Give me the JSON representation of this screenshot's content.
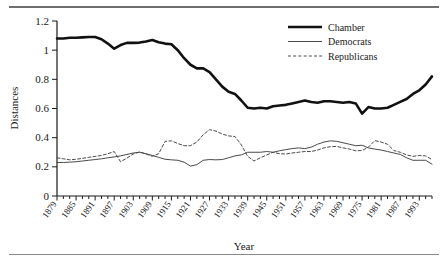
{
  "chart_data": {
    "type": "line",
    "title": "",
    "xlabel": "Year",
    "ylabel": "Distances",
    "ylim": [
      0,
      1.2
    ],
    "xlim": [
      1879,
      1997
    ],
    "yticks": [
      0,
      0.2,
      0.4,
      0.6,
      0.8,
      1,
      1.2
    ],
    "ytick_labels": [
      "0",
      "0.2",
      "0.4",
      "0.6",
      "0.8",
      "1",
      "1.2"
    ],
    "xticks": [
      1879,
      1885,
      1891,
      1897,
      1903,
      1909,
      1915,
      1921,
      1927,
      1933,
      1939,
      1945,
      1951,
      1957,
      1963,
      1969,
      1975,
      1981,
      1987,
      1993
    ],
    "xtick_labels": [
      "1879",
      "1885",
      "1891",
      "1897",
      "1903",
      "1909",
      "1915",
      "1921",
      "1927",
      "1933",
      "1939",
      "1945",
      "1951",
      "1957",
      "1963",
      "1969",
      "1975",
      "1981",
      "1987",
      "1993"
    ],
    "grid": false,
    "legend_position": "top-right",
    "x": [
      1879,
      1881,
      1883,
      1885,
      1887,
      1889,
      1891,
      1893,
      1895,
      1897,
      1899,
      1901,
      1903,
      1905,
      1907,
      1909,
      1911,
      1913,
      1915,
      1917,
      1919,
      1921,
      1923,
      1925,
      1927,
      1929,
      1931,
      1933,
      1935,
      1937,
      1939,
      1941,
      1943,
      1945,
      1947,
      1949,
      1951,
      1953,
      1955,
      1957,
      1959,
      1961,
      1963,
      1965,
      1967,
      1969,
      1971,
      1973,
      1975,
      1977,
      1979,
      1981,
      1983,
      1985,
      1987,
      1989,
      1991,
      1993,
      1995,
      1997
    ],
    "series": [
      {
        "name": "Chamber",
        "style": "thick-solid",
        "color": "#111111",
        "values": [
          1.08,
          1.08,
          1.085,
          1.085,
          1.088,
          1.09,
          1.09,
          1.075,
          1.045,
          1.01,
          1.035,
          1.05,
          1.05,
          1.052,
          1.06,
          1.07,
          1.055,
          1.045,
          1.04,
          1.0,
          0.945,
          0.9,
          0.875,
          0.875,
          0.85,
          0.8,
          0.75,
          0.715,
          0.7,
          0.655,
          0.605,
          0.6,
          0.605,
          0.6,
          0.615,
          0.62,
          0.625,
          0.635,
          0.645,
          0.655,
          0.645,
          0.64,
          0.65,
          0.65,
          0.645,
          0.64,
          0.645,
          0.635,
          0.565,
          0.61,
          0.6,
          0.6,
          0.605,
          0.625,
          0.645,
          0.665,
          0.7,
          0.725,
          0.765,
          0.82
        ]
      },
      {
        "name": "Democrats",
        "style": "thin-solid",
        "color": "#4a4a4a",
        "values": [
          0.23,
          0.23,
          0.232,
          0.235,
          0.24,
          0.245,
          0.25,
          0.255,
          0.262,
          0.268,
          0.275,
          0.285,
          0.295,
          0.3,
          0.29,
          0.278,
          0.265,
          0.252,
          0.248,
          0.245,
          0.232,
          0.205,
          0.215,
          0.245,
          0.25,
          0.248,
          0.25,
          0.262,
          0.275,
          0.282,
          0.3,
          0.3,
          0.3,
          0.305,
          0.3,
          0.31,
          0.318,
          0.325,
          0.33,
          0.325,
          0.335,
          0.355,
          0.37,
          0.378,
          0.375,
          0.365,
          0.355,
          0.345,
          0.348,
          0.33,
          0.322,
          0.315,
          0.305,
          0.295,
          0.285,
          0.262,
          0.245,
          0.245,
          0.245,
          0.218
        ]
      },
      {
        "name": "Republicans",
        "style": "dashed",
        "color": "#4a4a4a",
        "values": [
          0.262,
          0.255,
          0.248,
          0.252,
          0.258,
          0.265,
          0.272,
          0.278,
          0.29,
          0.305,
          0.235,
          0.26,
          0.288,
          0.302,
          0.288,
          0.272,
          0.29,
          0.375,
          0.378,
          0.36,
          0.345,
          0.345,
          0.37,
          0.42,
          0.455,
          0.445,
          0.425,
          0.412,
          0.408,
          0.35,
          0.272,
          0.24,
          0.262,
          0.282,
          0.3,
          0.29,
          0.288,
          0.295,
          0.3,
          0.305,
          0.305,
          0.315,
          0.33,
          0.338,
          0.34,
          0.33,
          0.322,
          0.31,
          0.312,
          0.335,
          0.38,
          0.37,
          0.355,
          0.312,
          0.3,
          0.282,
          0.272,
          0.278,
          0.275,
          0.25
        ]
      }
    ]
  },
  "legend": {
    "items": [
      {
        "label": "Chamber"
      },
      {
        "label": "Democrats"
      },
      {
        "label": "Republicans"
      }
    ]
  },
  "axes": {
    "y_title": "Distances",
    "x_title": "Year"
  }
}
